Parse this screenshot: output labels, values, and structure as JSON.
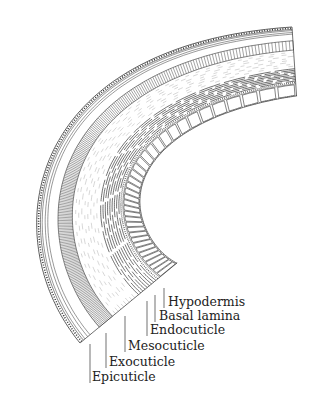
{
  "diagram": {
    "type": "cross-section of insect integument (cuticle layers)",
    "stroke_color": "#333333",
    "light_stroke_color": "#9a9a9a",
    "background": "#ffffff",
    "outer_curve": {
      "p0": [
        80,
        343
      ],
      "p1": [
        -5,
        240
      ],
      "p2": [
        20,
        45
      ],
      "p3": [
        292,
        27
      ]
    },
    "thickness_scale": {
      "start": 1.0,
      "end": 0.55
    },
    "layers": [
      {
        "name": "epicuticle",
        "from": 0,
        "to": 8,
        "pattern": "dotted-band"
      },
      {
        "name": "exocuticle",
        "from": 25,
        "to": 42,
        "pattern": "hatched"
      },
      {
        "name": "mesocuticle",
        "from": 42,
        "to": 75,
        "pattern": "wispy"
      },
      {
        "name": "endocuticle",
        "from": 75,
        "to": 100,
        "pattern": "lamellae"
      },
      {
        "name": "basal-lamina",
        "from": 100,
        "to": 104,
        "pattern": "stipple"
      },
      {
        "name": "hypodermis",
        "from": 104,
        "to": 126,
        "pattern": "cells"
      }
    ]
  },
  "labels": [
    {
      "id": "hypodermis",
      "text": "Hypodermis",
      "x": 168,
      "y": 296,
      "lead_x": 164,
      "lead_top": 288
    },
    {
      "id": "basal-lamina",
      "text": "Basal lamina",
      "x": 159,
      "y": 310,
      "lead_x": 155,
      "lead_top": 295
    },
    {
      "id": "endocuticle",
      "text": "Endocuticle",
      "x": 150,
      "y": 324,
      "lead_x": 147,
      "lead_top": 301
    },
    {
      "id": "mesocuticle",
      "text": "Mesocuticle",
      "x": 128,
      "y": 340,
      "lead_x": 125,
      "lead_top": 316
    },
    {
      "id": "exocuticle",
      "text": "Exocuticle",
      "x": 109,
      "y": 356,
      "lead_x": 106,
      "lead_top": 333
    },
    {
      "id": "epicuticle",
      "text": "Epicuticle",
      "x": 92,
      "y": 371,
      "lead_x": 90,
      "lead_top": 344
    }
  ]
}
